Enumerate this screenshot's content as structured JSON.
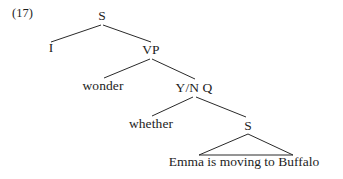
{
  "figure": {
    "example_number": "(17)",
    "background_color": "#ffffff",
    "line_color": "#2a2a2a",
    "text_color": "#1d1d1d"
  },
  "tree": {
    "nodes": [
      {
        "id": "s-top",
        "label": "S",
        "x": 102,
        "y": 16
      },
      {
        "id": "i",
        "label": "I",
        "x": 51,
        "y": 48
      },
      {
        "id": "vp",
        "label": "VP",
        "x": 151,
        "y": 50
      },
      {
        "id": "wonder",
        "label": "wonder",
        "x": 103,
        "y": 86
      },
      {
        "id": "ynq",
        "label": "Y/N Q",
        "x": 194,
        "y": 88
      },
      {
        "id": "whether",
        "label": "whether",
        "x": 151,
        "y": 124
      },
      {
        "id": "s-low",
        "label": "S",
        "x": 248,
        "y": 125
      },
      {
        "id": "terminal",
        "label": "Emma is moving to Buffalo",
        "x": 244,
        "y": 162
      }
    ],
    "branches": [
      {
        "from": "s-top",
        "to": "i",
        "x1": 101,
        "y1": 25,
        "x2": 51,
        "y2": 42
      },
      {
        "from": "s-top",
        "to": "vp",
        "x1": 103,
        "y1": 25,
        "x2": 151,
        "y2": 42
      },
      {
        "from": "vp",
        "to": "wonder",
        "x1": 150,
        "y1": 59,
        "x2": 104,
        "y2": 78
      },
      {
        "from": "vp",
        "to": "ynq",
        "x1": 152,
        "y1": 59,
        "x2": 195,
        "y2": 79
      },
      {
        "from": "ynq",
        "to": "whether",
        "x1": 193,
        "y1": 97,
        "x2": 152,
        "y2": 116
      },
      {
        "from": "ynq",
        "to": "s-low",
        "x1": 196,
        "y1": 97,
        "x2": 246,
        "y2": 117
      }
    ],
    "triangle": {
      "apex_x": 248,
      "apex_y": 134,
      "base_left_x": 199,
      "base_right_x": 293,
      "base_y": 155
    }
  }
}
